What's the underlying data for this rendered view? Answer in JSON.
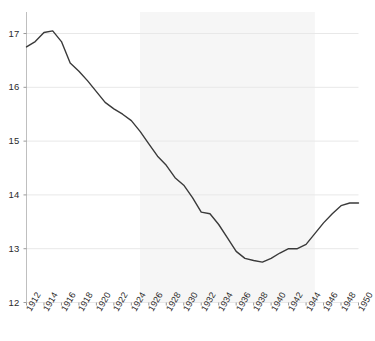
{
  "chart_data": {
    "type": "line",
    "title": "",
    "subtitle": "",
    "xlabel": "",
    "ylabel": "",
    "xlim": [
      1912,
      1950
    ],
    "ylim": [
      12,
      17.4
    ],
    "yticks": [
      12,
      13,
      14,
      15,
      16,
      17
    ],
    "ytick_labels": [
      "12",
      "13",
      "14",
      "15",
      "16",
      "17"
    ],
    "xticks": [
      1912,
      1914,
      1916,
      1918,
      1920,
      1922,
      1924,
      1926,
      1928,
      1930,
      1932,
      1934,
      1936,
      1938,
      1940,
      1942,
      1944,
      1946,
      1948,
      1950
    ],
    "xtick_labels": [
      "1912",
      "1914",
      "1916",
      "1918",
      "1920",
      "1922",
      "1924",
      "1926",
      "1928",
      "1930",
      "1932",
      "1934",
      "1936",
      "1938",
      "1940",
      "1942",
      "1944",
      "1946",
      "1948",
      "1950"
    ],
    "grid": true,
    "grid_axis": "y",
    "grid_color": "#e8e8e8",
    "legend": false,
    "legend_position": "none",
    "line_color": "#3a3a3a",
    "line_width": 1.4,
    "background_color": "#ffffff",
    "shaded_band": {
      "x_start": 1925,
      "x_end": 1945,
      "color": "#f6f6f6"
    },
    "x": [
      1912,
      1913,
      1914,
      1915,
      1916,
      1917,
      1918,
      1919,
      1920,
      1921,
      1922,
      1923,
      1924,
      1925,
      1926,
      1927,
      1928,
      1929,
      1930,
      1931,
      1932,
      1933,
      1934,
      1935,
      1936,
      1937,
      1938,
      1939,
      1940,
      1941,
      1942,
      1943,
      1944,
      1945,
      1946,
      1947,
      1948,
      1949,
      1950
    ],
    "values": [
      16.75,
      16.85,
      17.02,
      17.05,
      16.85,
      16.45,
      16.3,
      16.12,
      15.92,
      15.72,
      15.6,
      15.5,
      15.38,
      15.18,
      14.95,
      14.72,
      14.55,
      14.32,
      14.18,
      13.95,
      13.68,
      13.65,
      13.45,
      13.2,
      12.95,
      12.82,
      12.78,
      12.75,
      12.82,
      12.92,
      13.0,
      13.0,
      13.08,
      13.28,
      13.48,
      13.65,
      13.8,
      13.85,
      13.85
    ],
    "series": [
      {
        "name": "series-1",
        "x": [
          1912,
          1913,
          1914,
          1915,
          1916,
          1917,
          1918,
          1919,
          1920,
          1921,
          1922,
          1923,
          1924,
          1925,
          1926,
          1927,
          1928,
          1929,
          1930,
          1931,
          1932,
          1933,
          1934,
          1935,
          1936,
          1937,
          1938,
          1939,
          1940,
          1941,
          1942,
          1943,
          1944,
          1945,
          1946,
          1947,
          1948,
          1949,
          1950
        ],
        "values": [
          16.75,
          16.85,
          17.02,
          17.05,
          16.85,
          16.45,
          16.3,
          16.12,
          15.92,
          15.72,
          15.6,
          15.5,
          15.38,
          15.18,
          14.95,
          14.72,
          14.55,
          14.32,
          14.18,
          13.95,
          13.68,
          13.65,
          13.45,
          13.2,
          12.95,
          12.82,
          12.78,
          12.75,
          12.82,
          12.92,
          13.0,
          13.0,
          13.08,
          13.28,
          13.48,
          13.65,
          13.8,
          13.85,
          13.85
        ]
      }
    ],
    "annotations": []
  }
}
